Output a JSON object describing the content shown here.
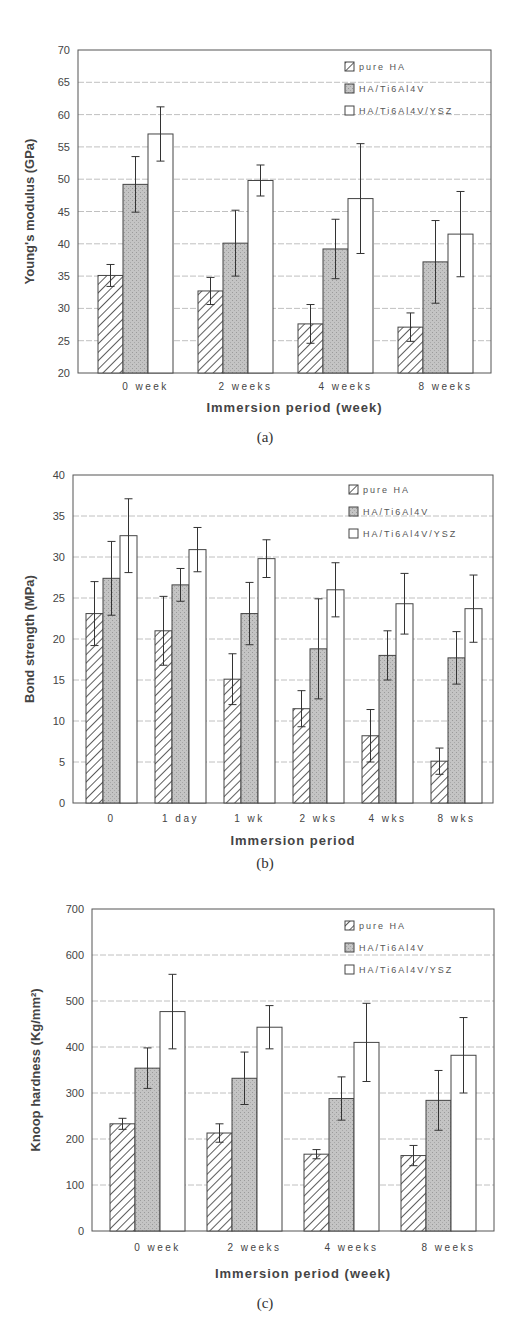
{
  "chart_data": [
    {
      "type": "bar",
      "panel": "(a)",
      "title": "",
      "xlabel": "Immersion period (week)",
      "ylabel": "Young's modulus (GPa)",
      "ylim": [
        20,
        70
      ],
      "yticks": [
        20,
        25,
        30,
        35,
        40,
        45,
        50,
        55,
        60,
        65,
        70
      ],
      "grid": true,
      "legend_position": "upper right",
      "categories": [
        "0 week",
        "2 weeks",
        "4 weeks",
        "8 weeks"
      ],
      "series": [
        {
          "name": "pure HA",
          "pattern": "hatched",
          "values": [
            35.1,
            32.7,
            27.6,
            27.1
          ],
          "errors": [
            1.7,
            2.1,
            3.0,
            2.2
          ]
        },
        {
          "name": "HA/Ti6Al4V",
          "pattern": "gray",
          "values": [
            49.2,
            40.1,
            39.2,
            37.2
          ],
          "errors": [
            4.3,
            5.1,
            4.6,
            6.4
          ]
        },
        {
          "name": "HA/Ti6Al4V/YSZ",
          "pattern": "white",
          "values": [
            57.0,
            49.8,
            47.0,
            41.5
          ],
          "errors": [
            4.2,
            2.4,
            8.5,
            6.6
          ]
        }
      ],
      "caption": "(a)"
    },
    {
      "type": "bar",
      "panel": "(b)",
      "title": "",
      "xlabel": "Immersion period",
      "ylabel": "Bond strength (MPa)",
      "ylim": [
        0,
        40
      ],
      "yticks": [
        0,
        5,
        10,
        15,
        20,
        25,
        30,
        35,
        40
      ],
      "grid": true,
      "legend_position": "upper right",
      "categories": [
        "0",
        "1 day",
        "1 wk",
        "2 wks",
        "4 wks",
        "8 wks"
      ],
      "series": [
        {
          "name": "pure HA",
          "pattern": "hatched",
          "values": [
            23.1,
            21.0,
            15.1,
            11.5,
            8.2,
            5.1
          ],
          "errors": [
            3.9,
            4.2,
            3.1,
            2.2,
            3.2,
            1.6
          ]
        },
        {
          "name": "HA/Ti6Al4V",
          "pattern": "gray",
          "values": [
            27.4,
            26.6,
            23.1,
            18.8,
            18.0,
            17.7
          ],
          "errors": [
            4.5,
            2.0,
            3.8,
            6.1,
            3.0,
            3.2
          ]
        },
        {
          "name": "HA/Ti6Al4V/YSZ",
          "pattern": "white",
          "values": [
            32.6,
            30.9,
            29.8,
            26.0,
            24.3,
            23.7
          ],
          "errors": [
            4.5,
            2.7,
            2.3,
            3.3,
            3.7,
            4.1
          ]
        }
      ],
      "caption": "(b)"
    },
    {
      "type": "bar",
      "panel": "(c)",
      "title": "",
      "xlabel": "Immersion period (week)",
      "ylabel": "Knoop hardness (Kg/mm²)",
      "ylim": [
        0,
        700
      ],
      "yticks": [
        0,
        100,
        200,
        300,
        400,
        500,
        600,
        700
      ],
      "grid": true,
      "legend_position": "upper right",
      "categories": [
        "0 week",
        "2 weeks",
        "4 weeks",
        "8 weeks"
      ],
      "series": [
        {
          "name": "pure HA",
          "pattern": "hatched",
          "values": [
            233,
            213,
            167,
            164
          ],
          "errors": [
            12,
            20,
            10,
            22
          ]
        },
        {
          "name": "HA/Ti6Al4V",
          "pattern": "gray",
          "values": [
            354,
            332,
            288,
            284
          ],
          "errors": [
            44,
            57,
            47,
            65
          ]
        },
        {
          "name": "HA/Ti6Al4V/YSZ",
          "pattern": "white",
          "values": [
            477,
            443,
            410,
            382
          ],
          "errors": [
            81,
            47,
            85,
            82
          ]
        }
      ],
      "caption": "(c)"
    }
  ]
}
